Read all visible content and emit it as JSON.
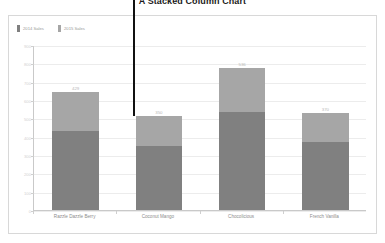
{
  "title": "A Stacked Column Chart",
  "legend": {
    "items": [
      {
        "label": "2014 Sales",
        "color": "#808080"
      },
      {
        "label": "2015 Sales",
        "color": "#a6a6a6"
      }
    ]
  },
  "axis": {
    "y_ticks": [
      "900",
      "800",
      "700",
      "600",
      "500",
      "400",
      "300",
      "200",
      "100",
      "0"
    ]
  },
  "chart_data": {
    "type": "bar",
    "stacked": true,
    "title": "A Stacked Column Chart",
    "xlabel": "",
    "ylabel": "",
    "ylim": [
      0,
      900
    ],
    "grid": true,
    "legend_position": "top-left",
    "categories": [
      "Razzle Dazzle Berry",
      "Coconut Mango",
      "Chocolicious",
      "French Vanilla"
    ],
    "series": [
      {
        "name": "2014 Sales",
        "color": "#808080",
        "values": [
          429,
          350,
          536,
          370
        ]
      },
      {
        "name": "2015 Sales",
        "color": "#a6a6a6",
        "values": [
          215,
          165,
          240,
          160
        ]
      }
    ],
    "data_labels": [
      "429",
      "350",
      "536",
      "370"
    ],
    "totals": [
      644,
      515,
      776,
      530
    ]
  },
  "annotation": {
    "cursor_label": "vertical-pointer-line",
    "color": "#111111"
  }
}
